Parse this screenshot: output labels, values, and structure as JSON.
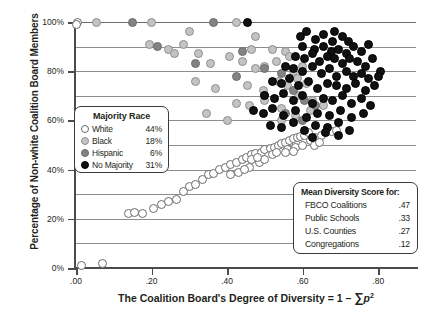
{
  "chart_data": {
    "type": "scatter",
    "title": "",
    "xlabel": "The Coalition Board's Degree of Diversity = 1 − ∑p²",
    "ylabel": "Percentage of Non-white Coalition Board Members",
    "xlim": [
      0.0,
      0.9
    ],
    "ylim": [
      0,
      100
    ],
    "xticks": [
      ".00",
      ".20",
      ".40",
      ".60",
      ".80"
    ],
    "xtick_values": [
      0.0,
      0.2,
      0.4,
      0.6,
      0.8
    ],
    "yticks": [
      "0%",
      "20%",
      "40%",
      "60%",
      "80%",
      "100%"
    ],
    "ytick_values": [
      0,
      20,
      40,
      60,
      80,
      100
    ],
    "gridlines_y": [
      10,
      20,
      30,
      40,
      50,
      60,
      70,
      80,
      90,
      100
    ],
    "grid": true,
    "legend_position": "inside-left",
    "series": [
      {
        "name": "White",
        "key": "white",
        "percent": "44%",
        "points": [
          [
            0.005,
            100
          ],
          [
            0.0,
            99
          ],
          [
            0.07,
            2
          ],
          [
            0.015,
            1
          ],
          [
            0.14,
            22
          ],
          [
            0.155,
            22.5
          ],
          [
            0.175,
            22
          ],
          [
            0.205,
            24
          ],
          [
            0.225,
            26
          ],
          [
            0.245,
            27
          ],
          [
            0.265,
            28
          ],
          [
            0.285,
            31
          ],
          [
            0.3,
            33
          ],
          [
            0.315,
            34
          ],
          [
            0.335,
            36
          ],
          [
            0.35,
            38
          ],
          [
            0.365,
            38.5
          ],
          [
            0.38,
            40
          ],
          [
            0.395,
            41
          ],
          [
            0.41,
            42
          ],
          [
            0.425,
            43
          ],
          [
            0.44,
            44
          ],
          [
            0.45,
            45
          ],
          [
            0.465,
            46
          ],
          [
            0.475,
            46.5
          ],
          [
            0.49,
            47
          ],
          [
            0.5,
            48
          ],
          [
            0.515,
            48.5
          ],
          [
            0.525,
            49
          ],
          [
            0.535,
            50
          ],
          [
            0.545,
            50.5
          ],
          [
            0.555,
            51
          ],
          [
            0.565,
            52
          ],
          [
            0.575,
            52.5
          ],
          [
            0.585,
            53
          ],
          [
            0.595,
            53.5
          ],
          [
            0.605,
            54
          ],
          [
            0.615,
            55
          ],
          [
            0.46,
            41
          ],
          [
            0.485,
            43
          ],
          [
            0.5,
            44
          ],
          [
            0.43,
            39
          ],
          [
            0.445,
            40
          ],
          [
            0.41,
            38
          ],
          [
            0.56,
            48
          ],
          [
            0.58,
            49
          ],
          [
            0.6,
            50
          ],
          [
            0.62,
            52
          ],
          [
            0.635,
            53
          ],
          [
            0.65,
            54
          ],
          [
            0.66,
            55
          ],
          [
            0.675,
            55.5
          ],
          [
            0.69,
            56
          ],
          [
            0.555,
            47
          ],
          [
            0.575,
            47.5
          ],
          [
            0.63,
            50
          ],
          [
            0.645,
            51
          ],
          [
            0.465,
            44
          ],
          [
            0.48,
            45
          ],
          [
            0.52,
            46
          ],
          [
            0.53,
            47
          ]
        ]
      },
      {
        "name": "Black",
        "key": "black_",
        "percent": "18%",
        "points": [
          [
            0.055,
            100
          ],
          [
            0.2,
            100
          ],
          [
            0.425,
            100
          ],
          [
            0.195,
            91
          ],
          [
            0.245,
            89
          ],
          [
            0.285,
            91
          ],
          [
            0.26,
            87
          ],
          [
            0.465,
            89
          ],
          [
            0.52,
            89
          ],
          [
            0.555,
            88
          ],
          [
            0.3,
            96
          ],
          [
            0.475,
            94
          ],
          [
            0.325,
            87
          ],
          [
            0.355,
            83
          ],
          [
            0.405,
            86
          ],
          [
            0.44,
            84
          ],
          [
            0.475,
            81
          ],
          [
            0.5,
            82
          ],
          [
            0.53,
            84
          ],
          [
            0.565,
            86
          ],
          [
            0.575,
            80
          ],
          [
            0.6,
            82
          ],
          [
            0.315,
            76
          ],
          [
            0.37,
            73
          ],
          [
            0.455,
            74
          ],
          [
            0.495,
            72
          ],
          [
            0.535,
            76
          ],
          [
            0.56,
            74
          ],
          [
            0.585,
            77
          ],
          [
            0.61,
            75
          ],
          [
            0.425,
            67
          ],
          [
            0.46,
            66
          ],
          [
            0.5,
            68
          ],
          [
            0.545,
            65
          ],
          [
            0.59,
            70
          ],
          [
            0.625,
            68
          ],
          [
            0.345,
            63
          ],
          [
            0.4,
            60
          ],
          [
            0.545,
            60
          ],
          [
            0.58,
            62
          ],
          [
            0.62,
            64
          ],
          [
            0.655,
            66
          ]
        ]
      },
      {
        "name": "Hispanic",
        "key": "hispanic",
        "percent": "6%",
        "points": [
          [
            0.15,
            100
          ],
          [
            0.365,
            100
          ],
          [
            0.215,
            90
          ],
          [
            0.44,
            88
          ],
          [
            0.315,
            83
          ],
          [
            0.5,
            81
          ],
          [
            0.545,
            79
          ],
          [
            0.425,
            78
          ],
          [
            0.575,
            72
          ],
          [
            0.5,
            70
          ],
          [
            0.605,
            68
          ],
          [
            0.635,
            66
          ],
          [
            0.555,
            63
          ],
          [
            0.6,
            60
          ]
        ]
      },
      {
        "name": "No Majority",
        "key": "nomaj",
        "percent": "31%",
        "points": [
          [
            0.455,
            100
          ],
          [
            0.61,
            96
          ],
          [
            0.685,
            96
          ],
          [
            0.595,
            94
          ],
          [
            0.635,
            93
          ],
          [
            0.655,
            95
          ],
          [
            0.68,
            92
          ],
          [
            0.705,
            94
          ],
          [
            0.72,
            92
          ],
          [
            0.6,
            90
          ],
          [
            0.63,
            89
          ],
          [
            0.655,
            90
          ],
          [
            0.675,
            88
          ],
          [
            0.695,
            89
          ],
          [
            0.715,
            87
          ],
          [
            0.735,
            90
          ],
          [
            0.755,
            88
          ],
          [
            0.775,
            91
          ],
          [
            0.58,
            86
          ],
          [
            0.605,
            85
          ],
          [
            0.625,
            87
          ],
          [
            0.645,
            84
          ],
          [
            0.665,
            86
          ],
          [
            0.685,
            85
          ],
          [
            0.705,
            83
          ],
          [
            0.725,
            85
          ],
          [
            0.745,
            84
          ],
          [
            0.765,
            82
          ],
          [
            0.785,
            85
          ],
          [
            0.805,
            80
          ],
          [
            0.555,
            82
          ],
          [
            0.575,
            81
          ],
          [
            0.6,
            80
          ],
          [
            0.625,
            82
          ],
          [
            0.65,
            79
          ],
          [
            0.67,
            81
          ],
          [
            0.69,
            78
          ],
          [
            0.715,
            80
          ],
          [
            0.735,
            78
          ],
          [
            0.755,
            79
          ],
          [
            0.775,
            77
          ],
          [
            0.8,
            78
          ],
          [
            0.52,
            76
          ],
          [
            0.545,
            75
          ],
          [
            0.565,
            77
          ],
          [
            0.59,
            74
          ],
          [
            0.615,
            76
          ],
          [
            0.64,
            73
          ],
          [
            0.665,
            75
          ],
          [
            0.69,
            74
          ],
          [
            0.715,
            73
          ],
          [
            0.74,
            75
          ],
          [
            0.765,
            72
          ],
          [
            0.79,
            74
          ],
          [
            0.5,
            70
          ],
          [
            0.525,
            69
          ],
          [
            0.55,
            71
          ],
          [
            0.575,
            68
          ],
          [
            0.6,
            70
          ],
          [
            0.625,
            67
          ],
          [
            0.655,
            69
          ],
          [
            0.68,
            68
          ],
          [
            0.705,
            70
          ],
          [
            0.73,
            67
          ],
          [
            0.755,
            69
          ],
          [
            0.78,
            66
          ],
          [
            0.47,
            64
          ],
          [
            0.495,
            63
          ],
          [
            0.52,
            65
          ],
          [
            0.55,
            62
          ],
          [
            0.58,
            64
          ],
          [
            0.61,
            61
          ],
          [
            0.64,
            63
          ],
          [
            0.67,
            62
          ],
          [
            0.7,
            64
          ],
          [
            0.73,
            61
          ],
          [
            0.76,
            63
          ],
          [
            0.515,
            58
          ],
          [
            0.545,
            57
          ],
          [
            0.575,
            59
          ],
          [
            0.605,
            56
          ],
          [
            0.635,
            58
          ],
          [
            0.665,
            57
          ],
          [
            0.695,
            59
          ],
          [
            0.725,
            56
          ],
          [
            0.625,
            53
          ],
          [
            0.66,
            55
          ],
          [
            0.695,
            54
          ]
        ]
      }
    ]
  },
  "legend": {
    "title": "Majority Race",
    "rows": [
      {
        "label": "White",
        "percent": "44%",
        "key": "white"
      },
      {
        "label": "Black",
        "percent": "18%",
        "key": "black_"
      },
      {
        "label": "Hispanic",
        "percent": "6%",
        "key": "hispanic"
      },
      {
        "label": "No Majority",
        "percent": "31%",
        "key": "nomaj"
      }
    ]
  },
  "mean_box": {
    "title": "Mean Diversity Score for:",
    "rows": [
      {
        "label": "FBCO Coalitions",
        "value": ".47"
      },
      {
        "label": "Public Schools",
        "value": ".33"
      },
      {
        "label": "U.S. Counties",
        "value": ".27"
      },
      {
        "label": "Congregations",
        "value": ".12"
      }
    ]
  },
  "axes": {
    "x_title_prefix": "The Coalition Board's Degree of Diversity = 1 – ",
    "x_title_sum": "∑",
    "x_title_var": "p",
    "x_title_exp": "2",
    "y_title": "Percentage of Non-white Coalition Board Members"
  },
  "colors": {
    "white": "#ffffff",
    "black_": "#c3c3c3",
    "hispanic": "#838383",
    "nomaj": "#111111",
    "grid": "#8d8d8d",
    "axis": "#4b4b4b",
    "text": "#231f20"
  }
}
